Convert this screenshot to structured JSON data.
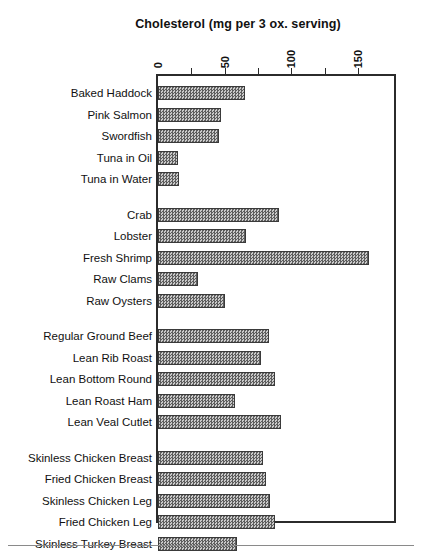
{
  "chart_data": {
    "type": "bar",
    "orientation": "horizontal",
    "title": "Cholesterol (mg per 3 ox. serving)",
    "xlabel": "",
    "ylabel": "",
    "xlim": [
      0,
      180
    ],
    "grid": false,
    "legend": null,
    "axis_position": "top",
    "tick_labels": [
      "0",
      "50",
      "100",
      "150"
    ],
    "tick_values": [
      0,
      50,
      100,
      150
    ],
    "minor_tick_values": [
      25,
      50,
      75,
      100,
      125,
      150
    ],
    "categories": [
      "Baked Haddock",
      "Pink Salmon",
      "Swordfish",
      "Tuna in Oil",
      "Tuna in Water",
      "Crab",
      "Lobster",
      "Fresh Shrimp",
      "Raw Clams",
      "Raw Oysters",
      "Regular Ground Beef",
      "Lean Rib Roast",
      "Lean Bottom Round",
      "Lean Roast Ham",
      "Lean Veal Cutlet",
      "Skinless Chicken Breast",
      "Fried Chicken Breast",
      "Skinless Chicken Leg",
      "Fried Chicken Leg",
      "Skinless Turkey Breast"
    ],
    "values": [
      65,
      47,
      46,
      15,
      16,
      91,
      66,
      158,
      30,
      50,
      83,
      77,
      88,
      58,
      92,
      79,
      81,
      84,
      88,
      59
    ],
    "groups": [
      {
        "name": "fish",
        "categories": [
          "Baked Haddock",
          "Pink Salmon",
          "Swordfish",
          "Tuna in Oil",
          "Tuna in Water"
        ]
      },
      {
        "name": "shellfish",
        "categories": [
          "Crab",
          "Lobster",
          "Fresh Shrimp",
          "Raw Clams",
          "Raw Oysters"
        ]
      },
      {
        "name": "meat",
        "categories": [
          "Regular Ground Beef",
          "Lean Rib Roast",
          "Lean Bottom Round",
          "Lean Roast Ham",
          "Lean Veal Cutlet"
        ]
      },
      {
        "name": "poultry",
        "categories": [
          "Skinless Chicken Breast",
          "Fried Chicken Breast",
          "Skinless Chicken Leg",
          "Fried Chicken Leg",
          "Skinless Turkey Breast"
        ]
      }
    ],
    "colors": {
      "bar_fill": "#8d8d8d",
      "bar_edge": "#3a3a3a",
      "frame": "#2b2b2b",
      "text": "#111111",
      "background": "#ffffff"
    }
  }
}
